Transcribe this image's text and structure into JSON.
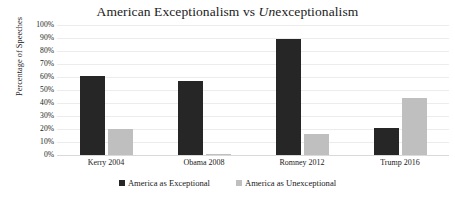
{
  "chart_data": {
    "type": "bar",
    "title": "American Exceptionalism vs Unexceptionalism",
    "title_parts": {
      "before": "American Exceptionalism vs ",
      "italic": "Un",
      "after": "exceptionalism"
    },
    "categories": [
      "Kerry 2004",
      "Obama 2008",
      "Romney 2012",
      "Trump 2016"
    ],
    "series": [
      {
        "name": "America as Exceptional",
        "color": "#262626",
        "values": [
          61,
          57,
          89,
          21
        ]
      },
      {
        "name": "America as Unexceptional",
        "color": "#bfbfbf",
        "values": [
          20,
          1,
          16,
          44
        ]
      }
    ],
    "xlabel": "",
    "ylabel": "Percentage of Speeches",
    "ylim": [
      0,
      100
    ],
    "ytick_labels": [
      "100%",
      "90%",
      "80%",
      "70%",
      "60%",
      "50%",
      "40%",
      "30%",
      "20%",
      "10%",
      "0%"
    ],
    "ytick_values": [
      100,
      90,
      80,
      70,
      60,
      50,
      40,
      30,
      20,
      10,
      0
    ],
    "grid": true,
    "grid_orientation": "horizontal",
    "legend_position": "bottom-center",
    "background_color": "#ffffff",
    "grid_color": "#ececec"
  }
}
